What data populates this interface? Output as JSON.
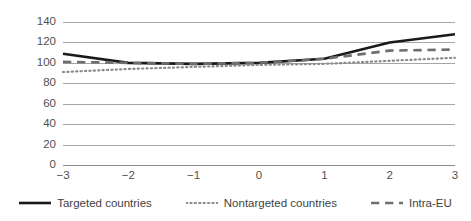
{
  "chart_data": {
    "type": "line",
    "title": "",
    "subtitle": "",
    "xlabel": "",
    "ylabel": "",
    "x": [
      -3,
      -2,
      -1,
      0,
      1,
      2,
      3
    ],
    "xtick_labels": [
      "−3",
      "−2",
      "−1",
      "0",
      "1",
      "2",
      "3"
    ],
    "ytick_labels": [
      "140",
      "120",
      "100",
      "80",
      "60",
      "40",
      "20",
      "0"
    ],
    "ytick_values": [
      140,
      120,
      100,
      80,
      60,
      40,
      20,
      0
    ],
    "ylim": [
      0,
      140
    ],
    "xlim": [
      -3,
      3
    ],
    "grid": "horizontal",
    "legend_position": "bottom",
    "series": [
      {
        "name": "Targeted countries",
        "style": "solid",
        "color": "#1a1a1a",
        "width": 2.6,
        "values": [
          109,
          100,
          99,
          100,
          104,
          120,
          128
        ]
      },
      {
        "name": "Nontargeted countries",
        "style": "dotted",
        "color": "#8a8a8a",
        "width": 2.2,
        "values": [
          91,
          94,
          96,
          98,
          99,
          102,
          105
        ]
      },
      {
        "name": "Intra-EU",
        "style": "dashed",
        "color": "#6e6e6e",
        "width": 2.6,
        "values": [
          101,
          100,
          99,
          100,
          104,
          112,
          113
        ]
      }
    ]
  },
  "legend": {
    "items": [
      {
        "label": "Targeted countries"
      },
      {
        "label": "Nontargeted countries"
      },
      {
        "label": "Intra-EU"
      }
    ]
  },
  "colors": {
    "gridline": "#a6a6a6",
    "axis_text": "#4f4f4f",
    "background": "#ffffff"
  }
}
